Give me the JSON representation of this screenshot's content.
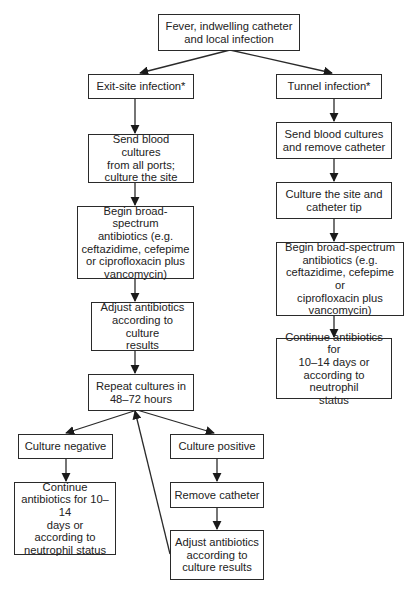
{
  "diagram": {
    "type": "flowchart",
    "nodes": {
      "start": "Fever, indwelling catheter\nand local infection",
      "exit_site": "Exit-site infection*",
      "tunnel": "Tunnel infection*",
      "exit_send_cultures": "Send blood cultures\nfrom all ports;\nculture the site",
      "exit_begin_antibiotics": "Begin broad-spectrum\nantibiotics (e.g.\nceftazidime, cefepime\nor ciprofloxacin plus\nvancomycin)",
      "exit_adjust_antibiotics": "Adjust antibiotics\naccording to culture\nresults",
      "repeat_cultures": "Repeat cultures in\n48–72 hours",
      "culture_negative": "Culture negative",
      "culture_positive": "Culture positive",
      "negative_continue": "Continue\nantibiotics for 10–14\ndays or\naccording to\nneutrophil status",
      "remove_catheter": "Remove catheter",
      "positive_adjust": "Adjust antibiotics\naccording to\nculture results",
      "tunnel_send_cultures": "Send blood cultures\nand remove catheter",
      "tunnel_culture_site": "Culture the site and\ncatheter tip",
      "tunnel_begin_antibiotics": "Begin broad-spectrum\nantibiotics (e.g.\nceftazidime, cefepime or\nciprofloxacin plus\nvancomycin)",
      "tunnel_continue": "Continue antibiotics for\n10–14 days or\naccording to neutrophil\nstatus"
    },
    "edges": [
      [
        "start",
        "exit_site"
      ],
      [
        "start",
        "tunnel"
      ],
      [
        "exit_site",
        "exit_send_cultures"
      ],
      [
        "exit_send_cultures",
        "exit_begin_antibiotics"
      ],
      [
        "exit_begin_antibiotics",
        "exit_adjust_antibiotics"
      ],
      [
        "exit_adjust_antibiotics",
        "repeat_cultures"
      ],
      [
        "repeat_cultures",
        "culture_negative"
      ],
      [
        "repeat_cultures",
        "culture_positive"
      ],
      [
        "culture_negative",
        "negative_continue"
      ],
      [
        "culture_positive",
        "remove_catheter"
      ],
      [
        "remove_catheter",
        "positive_adjust"
      ],
      [
        "positive_adjust",
        "repeat_cultures"
      ],
      [
        "tunnel",
        "tunnel_send_cultures"
      ],
      [
        "tunnel_send_cultures",
        "tunnel_culture_site"
      ],
      [
        "tunnel_culture_site",
        "tunnel_begin_antibiotics"
      ],
      [
        "tunnel_begin_antibiotics",
        "tunnel_continue"
      ]
    ],
    "colors": {
      "line": "#2a2a2a",
      "background": "#ffffff",
      "text": "#222222"
    }
  }
}
